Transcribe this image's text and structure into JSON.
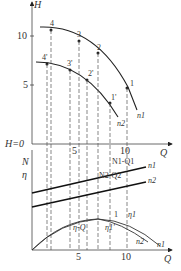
{
  "top_chart": {
    "y_axis_label": "H",
    "y_ticks": [
      "10",
      "5"
    ],
    "baseline_label": "H=0",
    "x_axis_label": "Q",
    "x_ticks": [
      "5",
      "10"
    ],
    "curve_labels": [
      "n1",
      "n2"
    ],
    "points_n1": [
      "1",
      "2",
      "3",
      "4"
    ],
    "points_n2": [
      "1'",
      "2'",
      "3'",
      "4'"
    ]
  },
  "bottom_chart": {
    "y_axis_label_1": "N",
    "y_axis_label_2": "η",
    "x_axis_label": "Q",
    "x_ticks": [
      "5",
      "10"
    ],
    "line_labels": [
      "N1-Q1",
      "N2-Q2"
    ],
    "line_curve_labels": [
      "n1",
      "n2"
    ],
    "eff_labels": [
      "η-Q",
      "η1'",
      "η1",
      "1"
    ],
    "eff_curve_labels": [
      "n2",
      "n1"
    ]
  }
}
